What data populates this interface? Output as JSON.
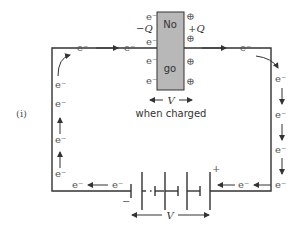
{
  "figure": {
    "label": "(i)",
    "capacitor": {
      "top_text": "No",
      "bottom_text": "go",
      "neg_charge": "−Q",
      "pos_charge": "+Q",
      "voltage": "V",
      "caption": "when charged",
      "plate_color": "#b8b8b8",
      "electron_label": "e⁻",
      "positive_symbol": "⊕"
    },
    "battery": {
      "voltage": "V",
      "plus": "+",
      "minus": "−"
    },
    "electron_label": "e⁻",
    "colors": {
      "wire": "#333333",
      "text": "#555555",
      "plate": "#b8b8b8"
    }
  }
}
